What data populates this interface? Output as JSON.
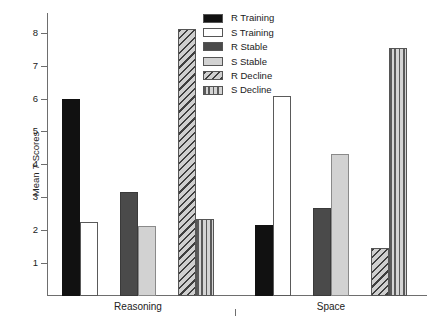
{
  "chart_data": {
    "type": "bar",
    "title": "",
    "subtitle": "",
    "xlabel": "",
    "ylabel": "Mean T Scores",
    "ylabel_parts": {
      "pre": "Mean ",
      "italic": "T",
      "post": " Scores"
    },
    "categories": [
      "Reasoning",
      "Space"
    ],
    "ylim": [
      0,
      8.6
    ],
    "yticks": [
      1,
      2,
      3,
      4,
      5,
      6,
      7,
      8
    ],
    "ytick_labels": [
      "1",
      "2",
      "3",
      "4",
      "5",
      "6",
      "7",
      "8"
    ],
    "grid": false,
    "legend_position": "top-center-right",
    "series": [
      {
        "name": "R Training",
        "values": [
          6.0,
          2.17
        ],
        "pattern": "solid-black",
        "color": "#111111"
      },
      {
        "name": "S Training",
        "values": [
          2.26,
          6.07
        ],
        "pattern": "white",
        "color": "#ffffff"
      },
      {
        "name": "R Stable",
        "values": [
          3.17,
          2.68
        ],
        "pattern": "dark-gray",
        "color": "#4a4a4a"
      },
      {
        "name": "S Stable",
        "values": [
          2.14,
          4.33
        ],
        "pattern": "light-gray",
        "color": "#d2d2d2"
      },
      {
        "name": "R Decline",
        "values": [
          8.1,
          1.45
        ],
        "pattern": "diag-hatch",
        "color": "#c9c9c9"
      },
      {
        "name": "S Decline",
        "values": [
          2.34,
          7.55
        ],
        "pattern": "vert-stripe",
        "color": "#bdbdbd"
      }
    ],
    "annotations": []
  },
  "legend": {
    "items": [
      {
        "label": "R Training"
      },
      {
        "label": "S Training"
      },
      {
        "label": "R Stable"
      },
      {
        "label": "S Stable"
      },
      {
        "label": "R Decline"
      },
      {
        "label": "S Decline"
      }
    ]
  },
  "axes": {
    "y_title": "Mean T Scores",
    "y_ticks": [
      "1",
      "2",
      "3",
      "4",
      "5",
      "6",
      "7",
      "8"
    ],
    "x_groups": [
      "Reasoning",
      "Space"
    ]
  }
}
